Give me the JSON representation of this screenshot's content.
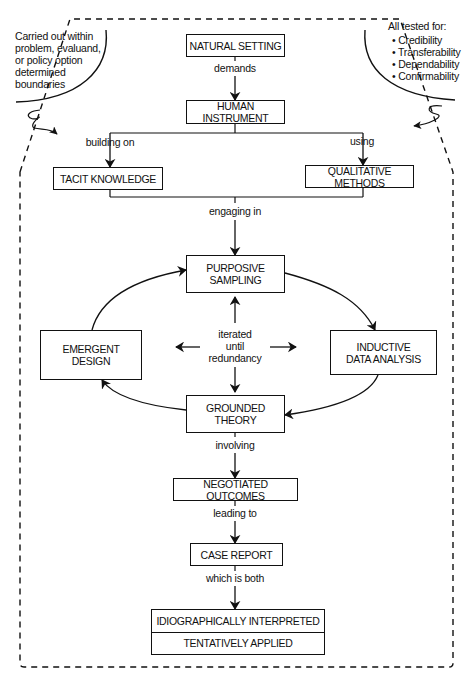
{
  "diagram": {
    "notes": {
      "left": "Carried out within problem, evaluand, or policy option determined boundaries",
      "left_lines": [
        "Carried out within",
        "problem, evaluand,",
        "or policy option",
        "determined",
        "boundaries"
      ],
      "right_title": "All tested for:",
      "right_items": [
        "Credibility",
        "Transferability",
        "Dependability",
        "Confirmability"
      ]
    },
    "nodes": {
      "natural_setting": "NATURAL SETTING",
      "human_instrument": "HUMAN INSTRUMENT",
      "tacit_knowledge": "TACIT KNOWLEDGE",
      "qualitative_methods": "QUALITATIVE METHODS",
      "purposive_sampling": [
        "PURPOSIVE",
        "SAMPLING"
      ],
      "emergent_design": [
        "EMERGENT",
        "DESIGN"
      ],
      "inductive_data_analysis": [
        "INDUCTIVE",
        "DATA ANALYSIS"
      ],
      "grounded_theory": [
        "GROUNDED",
        "THEORY"
      ],
      "negotiated_outcomes": "NEGOTIATED OUTCOMES",
      "case_report": "CASE REPORT",
      "final_top": "IDIOGRAPHICALLY INTERPRETED",
      "final_bottom": "TENTATIVELY APPLIED"
    },
    "edges": {
      "demands": "demands",
      "building_on": "building on",
      "using": "using",
      "engaging_in": "engaging in",
      "center": [
        "iterated",
        "until",
        "redundancy"
      ],
      "involving": "involving",
      "leading_to": "leading to",
      "which_is_both": "which is both"
    }
  }
}
